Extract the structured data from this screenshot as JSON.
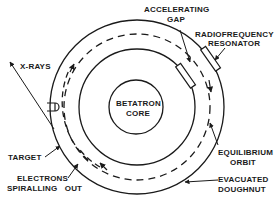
{
  "diagram": {
    "labels": {
      "x_rays": "X-RAYS",
      "accelerating_gap_1": "ACCELERATING",
      "accelerating_gap_2": "GAP",
      "rf_resonator_1": "RADIOFREQUENCY",
      "rf_resonator_2": "RESONATOR",
      "core_1": "BETATRON",
      "core_2": "CORE",
      "target": "TARGET",
      "electrons_1": "ELECTRONS",
      "electrons_2": "SPIRALLING   OUT",
      "equilibrium_1": "EQUILIBRIUM",
      "equilibrium_2": "ORBIT",
      "doughnut_1": "EVACUATED",
      "doughnut_2": "DOUGHNUT"
    },
    "colors": {
      "ink": "#1a1a1a",
      "background": "#ffffff"
    }
  }
}
